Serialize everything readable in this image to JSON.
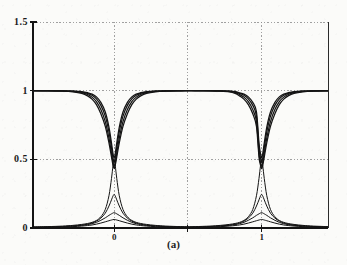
{
  "figure": {
    "caption": "(a)",
    "background_color": "#fbfbf9",
    "ink_color": "#141414",
    "grid_color": "#8a8a8a"
  },
  "chart_data": {
    "type": "line",
    "title": "",
    "xlabel": "",
    "ylabel": "",
    "xlim": [
      -0.55,
      1.45
    ],
    "ylim": [
      0.0,
      1.5
    ],
    "grid": true,
    "grid_style": "dotted",
    "legend": "none",
    "y_ticks": [
      0,
      0.5,
      1,
      1.5
    ],
    "y_tick_labels": [
      "0",
      "0.5",
      "1",
      "1.5"
    ],
    "x_ticks": [
      0,
      1
    ],
    "x_tick_labels": [
      "0",
      "1"
    ],
    "x_gridlines": [
      0,
      0.5,
      1
    ],
    "series": [
      {
        "name": "notch-1",
        "group": "upper",
        "x": [
          -0.55,
          -0.45,
          -0.35,
          -0.28,
          -0.22,
          -0.18,
          -0.15,
          -0.12,
          -0.09,
          -0.06,
          -0.035,
          -0.018,
          -0.008,
          0.0,
          0.008,
          0.018,
          0.035,
          0.06,
          0.09,
          0.12,
          0.15,
          0.18,
          0.22,
          0.28,
          0.35,
          0.45,
          0.5,
          0.55,
          0.65,
          0.72,
          0.78,
          0.82,
          0.85,
          0.88,
          0.91,
          0.94,
          0.965,
          0.982,
          0.992,
          1.0,
          1.008,
          1.018,
          1.035,
          1.06,
          1.09,
          1.12,
          1.15,
          1.18,
          1.22,
          1.28,
          1.35,
          1.45
        ],
        "y": [
          1.0,
          1.0,
          0.999,
          0.997,
          0.993,
          0.985,
          0.975,
          0.955,
          0.915,
          0.845,
          0.735,
          0.62,
          0.545,
          0.51,
          0.545,
          0.62,
          0.735,
          0.845,
          0.915,
          0.955,
          0.975,
          0.985,
          0.993,
          0.997,
          0.999,
          1.0,
          1.0,
          1.0,
          1.0,
          0.999,
          0.997,
          0.993,
          0.985,
          0.975,
          0.955,
          0.915,
          0.845,
          0.62,
          0.545,
          0.51,
          0.545,
          0.62,
          0.735,
          0.845,
          0.915,
          0.955,
          0.975,
          0.985,
          0.993,
          0.997,
          0.999,
          1.0
        ]
      },
      {
        "name": "notch-2",
        "group": "upper",
        "x": [
          -0.55,
          -0.45,
          -0.35,
          -0.28,
          -0.22,
          -0.18,
          -0.15,
          -0.12,
          -0.09,
          -0.06,
          -0.035,
          -0.018,
          -0.008,
          0.0,
          0.008,
          0.018,
          0.035,
          0.06,
          0.09,
          0.12,
          0.15,
          0.18,
          0.22,
          0.28,
          0.35,
          0.45,
          0.5,
          0.55,
          0.65,
          0.72,
          0.78,
          0.82,
          0.85,
          0.88,
          0.91,
          0.94,
          0.965,
          0.982,
          0.992,
          1.0,
          1.008,
          1.018,
          1.035,
          1.06,
          1.09,
          1.12,
          1.15,
          1.18,
          1.22,
          1.28,
          1.35,
          1.45
        ],
        "y": [
          1.0,
          1.0,
          0.999,
          0.996,
          0.99,
          0.98,
          0.966,
          0.94,
          0.893,
          0.815,
          0.7,
          0.585,
          0.512,
          0.478,
          0.512,
          0.585,
          0.7,
          0.815,
          0.893,
          0.94,
          0.966,
          0.98,
          0.99,
          0.996,
          0.999,
          1.0,
          1.0,
          1.0,
          1.0,
          0.999,
          0.996,
          0.99,
          0.98,
          0.966,
          0.94,
          0.893,
          0.815,
          0.585,
          0.512,
          0.478,
          0.512,
          0.585,
          0.7,
          0.815,
          0.893,
          0.94,
          0.966,
          0.98,
          0.99,
          0.996,
          0.999,
          1.0
        ]
      },
      {
        "name": "notch-3",
        "group": "upper",
        "x": [
          -0.55,
          -0.45,
          -0.35,
          -0.28,
          -0.22,
          -0.18,
          -0.15,
          -0.12,
          -0.09,
          -0.06,
          -0.035,
          -0.018,
          -0.008,
          0.0,
          0.008,
          0.018,
          0.035,
          0.06,
          0.09,
          0.12,
          0.15,
          0.18,
          0.22,
          0.28,
          0.35,
          0.45,
          0.5,
          0.55,
          0.65,
          0.72,
          0.78,
          0.82,
          0.85,
          0.88,
          0.91,
          0.94,
          0.965,
          0.982,
          0.992,
          1.0,
          1.008,
          1.018,
          1.035,
          1.06,
          1.09,
          1.12,
          1.15,
          1.18,
          1.22,
          1.28,
          1.35,
          1.45
        ],
        "y": [
          1.0,
          0.999,
          0.998,
          0.994,
          0.986,
          0.972,
          0.953,
          0.92,
          0.862,
          0.775,
          0.655,
          0.545,
          0.478,
          0.448,
          0.478,
          0.545,
          0.655,
          0.775,
          0.862,
          0.92,
          0.953,
          0.972,
          0.986,
          0.994,
          0.998,
          0.999,
          1.0,
          1.0,
          0.999,
          0.998,
          0.994,
          0.986,
          0.972,
          0.953,
          0.92,
          0.862,
          0.775,
          0.545,
          0.478,
          0.448,
          0.478,
          0.545,
          0.655,
          0.775,
          0.862,
          0.92,
          0.953,
          0.972,
          0.986,
          0.994,
          0.998,
          0.999
        ]
      },
      {
        "name": "notch-4",
        "group": "upper",
        "x": [
          -0.55,
          -0.45,
          -0.35,
          -0.28,
          -0.22,
          -0.18,
          -0.15,
          -0.12,
          -0.09,
          -0.06,
          -0.035,
          -0.018,
          -0.008,
          0.0,
          0.008,
          0.018,
          0.035,
          0.06,
          0.09,
          0.12,
          0.15,
          0.18,
          0.22,
          0.28,
          0.35,
          0.45,
          0.5,
          0.55,
          0.65,
          0.72,
          0.78,
          0.82,
          0.85,
          0.88,
          0.91,
          0.94,
          0.965,
          0.982,
          0.992,
          1.0,
          1.008,
          1.018,
          1.035,
          1.06,
          1.09,
          1.12,
          1.15,
          1.18,
          1.22,
          1.28,
          1.35,
          1.45
        ],
        "y": [
          0.999,
          0.999,
          0.996,
          0.991,
          0.98,
          0.962,
          0.938,
          0.898,
          0.832,
          0.74,
          0.62,
          0.518,
          0.46,
          0.432,
          0.46,
          0.518,
          0.62,
          0.74,
          0.832,
          0.898,
          0.938,
          0.962,
          0.98,
          0.991,
          0.996,
          0.999,
          1.0,
          0.999,
          0.998,
          0.996,
          0.991,
          0.98,
          0.962,
          0.938,
          0.898,
          0.832,
          0.74,
          0.518,
          0.46,
          0.432,
          0.46,
          0.518,
          0.62,
          0.74,
          0.832,
          0.898,
          0.938,
          0.962,
          0.98,
          0.991,
          0.996,
          0.999
        ]
      },
      {
        "name": "pass-1",
        "group": "lower",
        "x": [
          -0.55,
          -0.45,
          -0.35,
          -0.28,
          -0.22,
          -0.18,
          -0.15,
          -0.12,
          -0.09,
          -0.06,
          -0.035,
          -0.018,
          -0.008,
          0.0,
          0.008,
          0.018,
          0.035,
          0.06,
          0.09,
          0.12,
          0.15,
          0.18,
          0.22,
          0.28,
          0.35,
          0.45,
          0.5,
          0.55,
          0.65,
          0.72,
          0.78,
          0.82,
          0.85,
          0.88,
          0.91,
          0.94,
          0.965,
          0.982,
          0.992,
          1.0,
          1.008,
          1.018,
          1.035,
          1.06,
          1.09,
          1.12,
          1.15,
          1.18,
          1.22,
          1.28,
          1.35,
          1.45
        ],
        "y": [
          0.008,
          0.01,
          0.014,
          0.019,
          0.026,
          0.033,
          0.041,
          0.055,
          0.082,
          0.135,
          0.235,
          0.36,
          0.45,
          0.5,
          0.45,
          0.36,
          0.235,
          0.135,
          0.082,
          0.055,
          0.041,
          0.033,
          0.026,
          0.019,
          0.014,
          0.01,
          0.009,
          0.01,
          0.014,
          0.019,
          0.026,
          0.033,
          0.041,
          0.055,
          0.082,
          0.135,
          0.235,
          0.36,
          0.45,
          0.5,
          0.45,
          0.36,
          0.235,
          0.135,
          0.082,
          0.055,
          0.041,
          0.033,
          0.026,
          0.019,
          0.014,
          0.01
        ]
      },
      {
        "name": "pass-2",
        "group": "lower",
        "x": [
          -0.55,
          -0.45,
          -0.35,
          -0.28,
          -0.22,
          -0.18,
          -0.15,
          -0.12,
          -0.09,
          -0.06,
          -0.035,
          -0.018,
          -0.008,
          0.0,
          0.008,
          0.018,
          0.035,
          0.06,
          0.09,
          0.12,
          0.15,
          0.18,
          0.22,
          0.28,
          0.35,
          0.45,
          0.5,
          0.55,
          0.65,
          0.72,
          0.78,
          0.82,
          0.85,
          0.88,
          0.91,
          0.94,
          0.965,
          0.982,
          0.992,
          1.0,
          1.008,
          1.018,
          1.035,
          1.06,
          1.09,
          1.12,
          1.15,
          1.18,
          1.22,
          1.28,
          1.35,
          1.45
        ],
        "y": [
          0.006,
          0.008,
          0.011,
          0.015,
          0.021,
          0.028,
          0.036,
          0.05,
          0.072,
          0.108,
          0.16,
          0.205,
          0.232,
          0.245,
          0.232,
          0.205,
          0.16,
          0.108,
          0.072,
          0.05,
          0.036,
          0.028,
          0.021,
          0.015,
          0.011,
          0.008,
          0.007,
          0.008,
          0.011,
          0.015,
          0.021,
          0.028,
          0.036,
          0.05,
          0.072,
          0.108,
          0.16,
          0.205,
          0.232,
          0.245,
          0.232,
          0.205,
          0.16,
          0.108,
          0.072,
          0.05,
          0.036,
          0.028,
          0.021,
          0.015,
          0.011,
          0.008
        ]
      },
      {
        "name": "pass-3",
        "group": "lower",
        "x": [
          -0.55,
          -0.45,
          -0.35,
          -0.28,
          -0.22,
          -0.18,
          -0.15,
          -0.12,
          -0.09,
          -0.06,
          -0.035,
          -0.018,
          -0.008,
          0.0,
          0.008,
          0.018,
          0.035,
          0.06,
          0.09,
          0.12,
          0.15,
          0.18,
          0.22,
          0.28,
          0.35,
          0.45,
          0.5,
          0.55,
          0.65,
          0.72,
          0.78,
          0.82,
          0.85,
          0.88,
          0.91,
          0.94,
          0.965,
          0.982,
          0.992,
          1.0,
          1.008,
          1.018,
          1.035,
          1.06,
          1.09,
          1.12,
          1.15,
          1.18,
          1.22,
          1.28,
          1.35,
          1.45
        ],
        "y": [
          0.005,
          0.007,
          0.01,
          0.014,
          0.019,
          0.025,
          0.031,
          0.041,
          0.056,
          0.074,
          0.092,
          0.103,
          0.109,
          0.112,
          0.109,
          0.103,
          0.092,
          0.074,
          0.056,
          0.041,
          0.031,
          0.025,
          0.019,
          0.014,
          0.01,
          0.007,
          0.006,
          0.007,
          0.01,
          0.014,
          0.019,
          0.025,
          0.031,
          0.041,
          0.056,
          0.074,
          0.092,
          0.103,
          0.109,
          0.112,
          0.109,
          0.103,
          0.092,
          0.074,
          0.056,
          0.041,
          0.031,
          0.025,
          0.019,
          0.014,
          0.01,
          0.007
        ]
      },
      {
        "name": "pass-4",
        "group": "lower",
        "x": [
          -0.55,
          -0.45,
          -0.35,
          -0.28,
          -0.22,
          -0.18,
          -0.15,
          -0.12,
          -0.09,
          -0.06,
          -0.035,
          -0.018,
          -0.008,
          0.0,
          0.008,
          0.018,
          0.035,
          0.06,
          0.09,
          0.12,
          0.15,
          0.18,
          0.22,
          0.28,
          0.35,
          0.45,
          0.5,
          0.55,
          0.65,
          0.72,
          0.78,
          0.82,
          0.85,
          0.88,
          0.91,
          0.94,
          0.965,
          0.982,
          0.992,
          1.0,
          1.008,
          1.018,
          1.035,
          1.06,
          1.09,
          1.12,
          1.15,
          1.18,
          1.22,
          1.28,
          1.35,
          1.45
        ],
        "y": [
          0.004,
          0.005,
          0.007,
          0.01,
          0.014,
          0.018,
          0.022,
          0.028,
          0.036,
          0.045,
          0.053,
          0.058,
          0.061,
          0.062,
          0.061,
          0.058,
          0.053,
          0.045,
          0.036,
          0.028,
          0.022,
          0.018,
          0.014,
          0.01,
          0.007,
          0.005,
          0.004,
          0.005,
          0.007,
          0.01,
          0.014,
          0.018,
          0.022,
          0.028,
          0.036,
          0.045,
          0.053,
          0.058,
          0.061,
          0.062,
          0.061,
          0.058,
          0.053,
          0.045,
          0.036,
          0.028,
          0.022,
          0.018,
          0.014,
          0.01,
          0.007,
          0.005
        ]
      }
    ]
  }
}
